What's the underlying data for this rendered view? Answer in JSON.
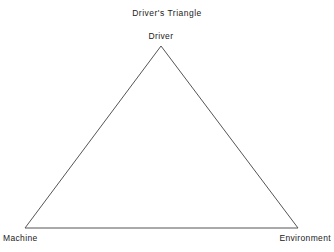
{
  "diagram": {
    "title": "Driver's Triangle",
    "type": "triangle",
    "background_color": "#ffffff",
    "stroke_color": "#555555",
    "stroke_width": 1,
    "text_color": "#222222",
    "vertices": [
      {
        "id": "driver",
        "label": "Driver",
        "x": 161,
        "y": 46,
        "label_position": "above"
      },
      {
        "id": "machine",
        "label": "Machine",
        "x": 25,
        "y": 228,
        "label_position": "below-left"
      },
      {
        "id": "environment",
        "label": "Environment",
        "x": 298,
        "y": 228,
        "label_position": "below-right"
      }
    ],
    "edges": [
      {
        "from": "driver",
        "to": "machine"
      },
      {
        "from": "driver",
        "to": "environment"
      },
      {
        "from": "machine",
        "to": "environment"
      }
    ]
  }
}
